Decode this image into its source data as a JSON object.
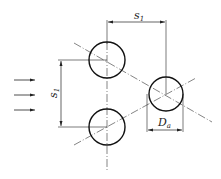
{
  "diagram": {
    "type": "tube-bank-staggered-layout",
    "flow_arrows": {
      "count": 3,
      "direction": "right"
    },
    "tubes": [
      {
        "id": "tube-top-left",
        "cx": 107,
        "cy": 60,
        "r": 18
      },
      {
        "id": "tube-bottom-left",
        "cx": 107,
        "cy": 127,
        "r": 18
      },
      {
        "id": "tube-right",
        "cx": 166,
        "cy": 94,
        "r": 17
      }
    ],
    "labels": {
      "horizontal_pitch": {
        "main": "s",
        "sub": "1"
      },
      "vertical_pitch": {
        "main": "s",
        "sub": "1"
      },
      "diameter": {
        "main": "D",
        "sub": "a"
      }
    },
    "colors": {
      "line": "#222222",
      "background": "#ffffff"
    }
  }
}
